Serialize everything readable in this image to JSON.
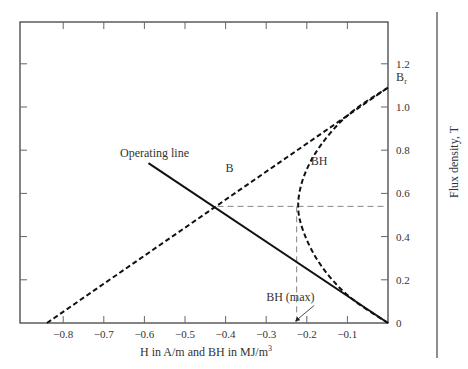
{
  "chart_data": {
    "type": "line",
    "title": "",
    "xlabel": "H in A/m and BH in MJ/m",
    "xlabel_superscript": "3",
    "ylabel": "Flux density, T",
    "xlim": [
      -0.9,
      0
    ],
    "ylim": [
      0,
      1.4
    ],
    "x_ticks": [
      -0.8,
      -0.7,
      -0.6,
      -0.5,
      -0.4,
      -0.3,
      -0.2,
      -0.1
    ],
    "x_tick_labels": [
      "−0.8",
      "−0.7",
      "−0.6",
      "−0.5",
      "−0.4",
      "−0.3",
      "−0.2",
      "−0.1"
    ],
    "y_ticks": [
      0,
      0.2,
      0.4,
      0.6,
      0.8,
      1.0,
      1.2
    ],
    "y_tick_labels": [
      "0",
      "0.2",
      "0.4",
      "0.6",
      "0.8",
      "1.0",
      "1.2"
    ],
    "grid": false,
    "series": [
      {
        "name": "B",
        "style": "dashed",
        "x": [
          -0.84,
          0
        ],
        "y": [
          0,
          1.09
        ]
      },
      {
        "name": "BH",
        "style": "dashed",
        "x": [
          0,
          -0.1,
          -0.17,
          -0.21,
          -0.225,
          -0.21,
          -0.17,
          -0.1,
          0
        ],
        "y": [
          0,
          0.12,
          0.27,
          0.42,
          0.54,
          0.68,
          0.82,
          0.97,
          1.09
        ]
      },
      {
        "name": "Operating line",
        "style": "solid",
        "x": [
          -0.59,
          0
        ],
        "y": [
          0.74,
          0
        ]
      }
    ],
    "guides": [
      {
        "name": "bh-max-horizontal",
        "style": "dashed-thin",
        "x": [
          -0.42,
          0
        ],
        "y": [
          0.54,
          0.54
        ]
      },
      {
        "name": "bh-max-vertical",
        "style": "dashed-thin",
        "x": [
          -0.225,
          -0.225
        ],
        "y": [
          0.54,
          0
        ]
      }
    ],
    "annotations": [
      {
        "text": "Operating line",
        "x": -0.66,
        "y": 0.77
      },
      {
        "text": "B",
        "x": -0.4,
        "y": 0.7
      },
      {
        "text": "BH",
        "x": -0.19,
        "y": 0.73
      },
      {
        "text": "BH (max)",
        "x": -0.3,
        "y": 0.1,
        "arrow_to": [
          -0.225,
          0
        ]
      },
      {
        "text": "B",
        "subscript": "r",
        "x": 0.02,
        "y": 1.12
      }
    ]
  }
}
